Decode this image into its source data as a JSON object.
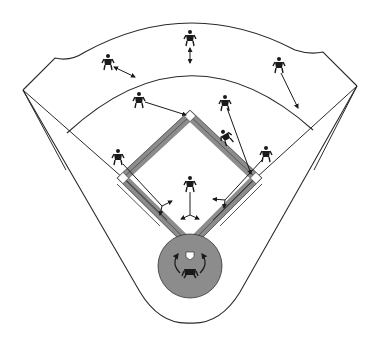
{
  "diagram": {
    "colors": {
      "line": "#2a2a2a",
      "basepath": "#8c8c8c",
      "mound": "#8c8c8c",
      "player": "#1a1a1a",
      "background": "#ffffff"
    },
    "regions": [
      "outfield-fence",
      "outfield-grass",
      "infield-grass",
      "baselines",
      "home-plate-circle"
    ],
    "bases": [
      "home-plate",
      "first-base",
      "second-base",
      "third-base"
    ],
    "players": [
      {
        "id": "left-fielder",
        "position": "left field",
        "arrow": "toward infield arc"
      },
      {
        "id": "center-fielder",
        "position": "center field",
        "arrow": "down toward infield arc"
      },
      {
        "id": "right-fielder",
        "position": "right field",
        "arrow": "toward infield arc"
      },
      {
        "id": "shortstop",
        "position": "shortstop",
        "arrow": "toward second base"
      },
      {
        "id": "second-baseman",
        "position": "second baseman",
        "arrow": "toward first base"
      },
      {
        "id": "runner",
        "position": "sliding runner near second-first basepath",
        "arrow": "none"
      },
      {
        "id": "third-baseman",
        "position": "third base",
        "arrow": "toward third base line"
      },
      {
        "id": "first-baseman",
        "position": "first base",
        "arrow": "toward first base"
      },
      {
        "id": "pitcher",
        "position": "pitcher's mound",
        "arrow": "toward home plate"
      },
      {
        "id": "catcher",
        "position": "catcher at home plate",
        "arrow": "circular rotation"
      }
    ]
  }
}
